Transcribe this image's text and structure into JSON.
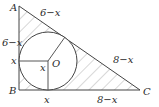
{
  "diagram": {
    "type": "right triangle with inscribed circle",
    "points": {
      "A": {
        "label": "A"
      },
      "B": {
        "label": "B"
      },
      "C": {
        "label": "C"
      },
      "O": {
        "label": "O"
      }
    },
    "segment_labels": {
      "AC_upper": "6−x",
      "AB_upper": "6−x",
      "AB_lower": "x",
      "radius_horizontal": "x",
      "BC_left": "x",
      "AC_lower": "8−x",
      "BC_right": "8−x"
    },
    "shading": "hatched region between triangle and circle",
    "colors": {
      "line": "#444444",
      "hatch": "#9a9a9a",
      "background": "#ffffff"
    }
  }
}
